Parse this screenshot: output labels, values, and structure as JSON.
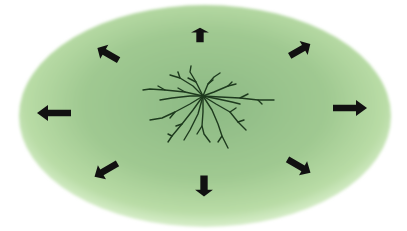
{
  "diagram": {
    "colors": {
      "background": "#ffffff",
      "field_center": "#8cb984",
      "field_mid": "#a3cc93",
      "field_edge": "#cde8bc",
      "arrow": "#111111",
      "branches": "#1e3a1e"
    },
    "field": {
      "cx": 205,
      "cy": 116,
      "rx": 186,
      "ry": 111
    },
    "center_figure": {
      "name": "branching-structure",
      "cx": 203,
      "cy": 98
    },
    "arrows": [
      {
        "direction": "up",
        "x": 200,
        "y": 35,
        "angle": -90
      },
      {
        "direction": "up-right",
        "x": 300,
        "y": 50,
        "angle": -30
      },
      {
        "direction": "right",
        "x": 350,
        "y": 108,
        "angle": 0
      },
      {
        "direction": "down-right",
        "x": 299,
        "y": 166,
        "angle": 30
      },
      {
        "direction": "down",
        "x": 204,
        "y": 186,
        "angle": 90
      },
      {
        "direction": "down-left",
        "x": 106,
        "y": 170,
        "angle": 150
      },
      {
        "direction": "left",
        "x": 54,
        "y": 113,
        "angle": 180
      },
      {
        "direction": "up-left",
        "x": 108,
        "y": 54,
        "angle": -150
      }
    ]
  }
}
